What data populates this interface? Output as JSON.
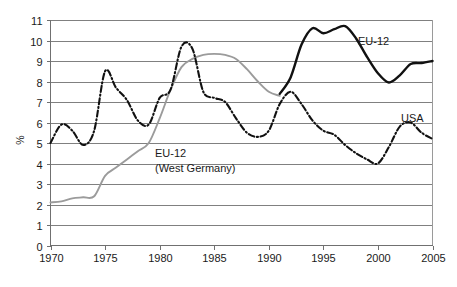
{
  "chart_data": {
    "type": "line",
    "title": "",
    "subtitle": "",
    "xlabel": "",
    "ylabel": "%",
    "xlim": [
      1970,
      2005
    ],
    "ylim": [
      0,
      11
    ],
    "grid": true,
    "grid_axis": "y",
    "legend": "inline-annotations",
    "x_ticks": [
      1970,
      1975,
      1980,
      1985,
      1990,
      1995,
      2000,
      2005
    ],
    "y_ticks": [
      0,
      1,
      2,
      3,
      4,
      5,
      6,
      7,
      8,
      9,
      10,
      11
    ],
    "series": [
      {
        "name": "EU-12 (West Germany)",
        "label": "EU-12",
        "label_line2": "(West Germany)",
        "style": "solid",
        "color": "#9b9b9b",
        "width": 1.9,
        "x": [
          1970,
          1971,
          1972,
          1973,
          1974,
          1975,
          1976,
          1977,
          1978,
          1979,
          1980,
          1981,
          1982,
          1983,
          1984,
          1985,
          1986,
          1987,
          1988,
          1989,
          1990,
          1991
        ],
        "values": [
          2.1,
          2.15,
          2.3,
          2.35,
          2.4,
          3.4,
          3.8,
          4.2,
          4.6,
          5.0,
          6.2,
          7.6,
          8.7,
          9.1,
          9.3,
          9.35,
          9.3,
          9.1,
          8.6,
          8.0,
          7.5,
          7.3
        ]
      },
      {
        "name": "EU-12",
        "label": "EU-12",
        "style": "solid",
        "color": "#111111",
        "width": 2.4,
        "x": [
          1991,
          1992,
          1993,
          1994,
          1995,
          1996,
          1997,
          1998,
          1999,
          2000,
          2001,
          2002,
          2003,
          2004,
          2005
        ],
        "values": [
          7.4,
          8.2,
          9.8,
          10.6,
          10.35,
          10.55,
          10.7,
          10.1,
          9.2,
          8.4,
          7.95,
          8.3,
          8.85,
          8.9,
          9.0
        ]
      },
      {
        "name": "USA",
        "label": "USA",
        "style": "dash-dot",
        "color": "#111111",
        "width": 2.1,
        "x": [
          1970,
          1971,
          1972,
          1973,
          1974,
          1975,
          1976,
          1977,
          1978,
          1979,
          1980,
          1981,
          1982,
          1983,
          1984,
          1985,
          1986,
          1987,
          1988,
          1989,
          1990,
          1991,
          1992,
          1993,
          1994,
          1995,
          1996,
          1997,
          1998,
          1999,
          2000,
          2001,
          2002,
          2003,
          2004,
          2005
        ],
        "values": [
          5.0,
          5.9,
          5.6,
          4.9,
          5.6,
          8.5,
          7.7,
          7.1,
          6.1,
          5.9,
          7.2,
          7.6,
          9.7,
          9.6,
          7.5,
          7.2,
          7.0,
          6.2,
          5.5,
          5.3,
          5.6,
          6.9,
          7.5,
          6.9,
          6.1,
          5.6,
          5.4,
          4.9,
          4.5,
          4.2,
          4.0,
          4.8,
          5.8,
          6.0,
          5.5,
          5.2
        ]
      }
    ],
    "annotations": [
      {
        "text": "EU-12",
        "series": "EU-12",
        "x_px": 358,
        "y_px": 45
      },
      {
        "text": "USA",
        "series": "USA",
        "x_px": 401,
        "y_px": 122
      },
      {
        "text": "EU-12",
        "series": "EU-12 (West Germany)",
        "x_px": 155,
        "y_px": 157
      },
      {
        "text": "(West Germany)",
        "series": "EU-12 (West Germany)",
        "x_px": 155,
        "y_px": 172
      }
    ],
    "colors": {
      "gridline": "#808080",
      "axis": "#707070",
      "eu12_black": "#111111",
      "west_germany_gray": "#9b9b9b",
      "background": "#ffffff"
    }
  }
}
